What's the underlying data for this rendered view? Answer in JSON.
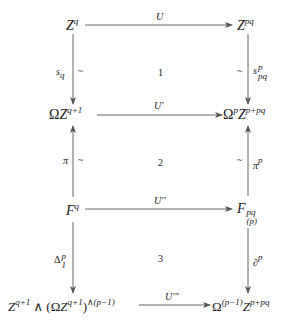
{
  "diagram": {
    "type": "commutative-diagram",
    "nodes": {
      "r1_left": {
        "base": "Z",
        "sup": "q"
      },
      "r1_right": {
        "base": "Z",
        "sup": "pq"
      },
      "r2_left": {
        "prefix": "Ω",
        "base": "Z",
        "sup": "q+1"
      },
      "r2_right": {
        "prefix": "Ω",
        "prefix_sup": "p",
        "base": "Z",
        "sup": "p+pq"
      },
      "r3_left": {
        "base": "F",
        "sup": "q"
      },
      "r3_right": {
        "base": "F",
        "sup": "pq",
        "sub": "(p)"
      },
      "r4_left": {
        "base": "Z",
        "sup": "q+1",
        "wedge": "∧",
        "paren_open": "(Ω",
        "inner_base": "Z",
        "inner_sup": "q+1",
        "paren_close": ")",
        "outer_sup": "∧(p−1)"
      },
      "r4_right": {
        "prefix": "Ω",
        "prefix_sup": "(p−1)",
        "base": "Z",
        "sup": "p+pq"
      }
    },
    "horizontal_arrows": [
      {
        "label": "U"
      },
      {
        "label": "U′"
      },
      {
        "label": "U′′"
      },
      {
        "label": "U′′′"
      }
    ],
    "left_arrows": [
      {
        "direction": "down",
        "label_base": "s",
        "label_sub": "q",
        "equiv": "~"
      },
      {
        "direction": "up",
        "label_base": "π",
        "equiv": "~"
      },
      {
        "direction": "down",
        "label_base": "Δ",
        "label_sup": "p",
        "label_sub": "1"
      }
    ],
    "right_arrows": [
      {
        "direction": "down",
        "label_base": "s",
        "label_sup": "p",
        "label_sub": "pq",
        "equiv": "~"
      },
      {
        "direction": "up",
        "label_base": "π",
        "label_sup": "p",
        "equiv": "~"
      },
      {
        "direction": "down",
        "label_base": "∂",
        "label_sup": "p"
      }
    ],
    "cells": [
      "1",
      "2",
      "3"
    ],
    "colors": {
      "line": "#555555",
      "text": "#1a1a1a",
      "background": "#ffffff"
    }
  }
}
